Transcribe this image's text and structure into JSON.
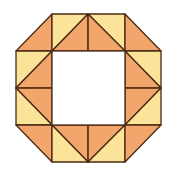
{
  "figure": {
    "colors": {
      "orange": "#F2A66B",
      "yellow": "#FBE49A",
      "stroke": "#4A2A14",
      "hole": "#FFFFFF"
    },
    "grid": {
      "x": [
        16,
        52,
        88,
        125,
        161
      ],
      "y": [
        14,
        51,
        88,
        125,
        162
      ]
    }
  }
}
